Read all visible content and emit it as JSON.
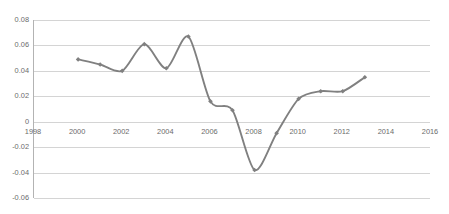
{
  "chart_data": {
    "type": "line",
    "title": "",
    "subtitle": "",
    "xlabel": "",
    "ylabel": "",
    "xlim": [
      1998,
      2016
    ],
    "ylim": [
      -0.06,
      0.08
    ],
    "grid": true,
    "legend": null,
    "legend_position": "none",
    "markers": "diamond",
    "line_color": "#808080",
    "marker_color": "#808080",
    "gridline_color": "#d4d4d4",
    "axis_color": "#b3b3b3",
    "text_color": "#6b6b6b",
    "x_ticks": [
      "1998",
      "2000",
      "2002",
      "2004",
      "2006",
      "2008",
      "2010",
      "2012",
      "2014",
      "2016"
    ],
    "x_tick_values": [
      1998,
      2000,
      2002,
      2004,
      2006,
      2008,
      2010,
      2012,
      2014,
      2016
    ],
    "y_ticks": [
      "0.08",
      "0.06",
      "0.04",
      "0.02",
      "0",
      "-0.02",
      "-0.04",
      "-0.06"
    ],
    "y_tick_values": [
      0.08,
      0.06,
      0.04,
      0.02,
      0,
      -0.02,
      -0.04,
      -0.06
    ],
    "x": [
      2000,
      2001,
      2002,
      2003,
      2004,
      2005,
      2006,
      2007,
      2008,
      2009,
      2010,
      2011,
      2012,
      2013
    ],
    "values": [
      0.049,
      0.045,
      0.04,
      0.061,
      0.042,
      0.067,
      0.016,
      0.009,
      -0.038,
      -0.009,
      0.018,
      0.024,
      0.024,
      0.035
    ],
    "series": [
      {
        "name": "Series 1",
        "x": [
          2000,
          2001,
          2002,
          2003,
          2004,
          2005,
          2006,
          2007,
          2008,
          2009,
          2010,
          2011,
          2012,
          2013
        ],
        "values": [
          0.049,
          0.045,
          0.04,
          0.061,
          0.042,
          0.067,
          0.016,
          0.009,
          -0.038,
          -0.009,
          0.018,
          0.024,
          0.024,
          0.035
        ]
      }
    ]
  }
}
